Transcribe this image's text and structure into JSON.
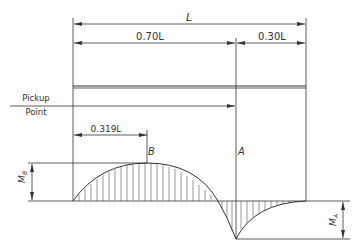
{
  "diagram": {
    "type": "bending-moment-diagram",
    "dimensions": {
      "total": "L",
      "left_segment": "0.70L",
      "right_segment": "0.30L",
      "peak_location": "0.319L"
    },
    "labels": {
      "pickup_line1": "Pickup",
      "pickup_line2": "Point",
      "point_b": "B",
      "point_a": "A",
      "moment_b": "M",
      "moment_b_sub": "B",
      "moment_a": "M",
      "moment_a_sub": "A"
    },
    "colors": {
      "line": "#333333",
      "background": "#ffffff"
    }
  }
}
